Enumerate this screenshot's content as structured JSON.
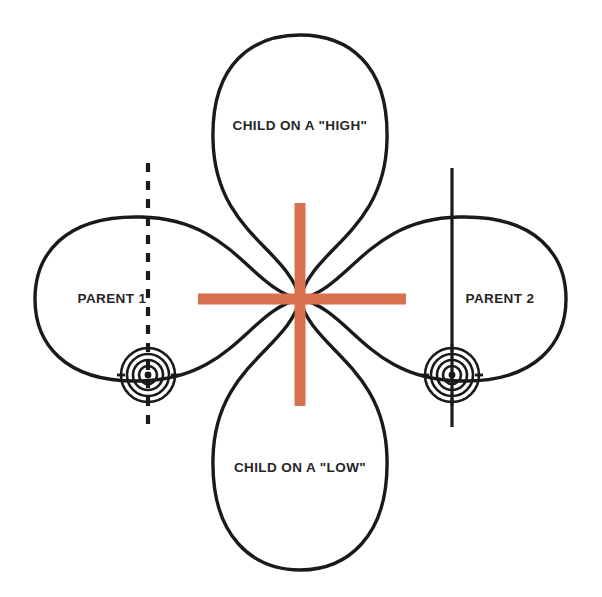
{
  "figure": {
    "background_color": "#ffffff",
    "stroke_color": "#1a1a1a",
    "accent_color": "#D9714E"
  },
  "labels": {
    "top": "CHILD ON A \"HIGH\"",
    "bottom": "CHILD ON A \"LOW\"",
    "left": "PARENT 1",
    "right": "PARENT 2"
  },
  "icons": {
    "cross": "orange-cross-icon",
    "target_left": "bullseye-target-icon",
    "target_right": "bullseye-target-icon",
    "axis_left": "dashed-vertical-axis-icon",
    "axis_right": "solid-vertical-axis-icon"
  },
  "chart_data": {
    "type": "diagram",
    "center": [
      300,
      299
    ],
    "petals": [
      {
        "name": "CHILD ON A \"HIGH\"",
        "direction": "up",
        "tip": [
          300,
          35
        ],
        "half_width": 85,
        "label_at": [
          300,
          125
        ]
      },
      {
        "name": "CHILD ON A \"LOW\"",
        "direction": "down",
        "tip": [
          300,
          570
        ],
        "half_width": 88,
        "label_at": [
          300,
          467
        ]
      },
      {
        "name": "PARENT 1",
        "direction": "left",
        "tip": [
          35,
          299
        ],
        "half_width": 86,
        "label_at": [
          112,
          298
        ]
      },
      {
        "name": "PARENT 2",
        "direction": "right",
        "tip": [
          566,
          299
        ],
        "half_width": 86,
        "label_at": [
          500,
          298
        ]
      }
    ],
    "cross": {
      "color": "#D9714E",
      "thickness": 11,
      "horizontal": {
        "x1": 198,
        "x2": 406,
        "y": 299
      },
      "vertical": {
        "y1": 203,
        "y2": 406,
        "x": 300
      }
    },
    "targets": [
      {
        "name": "target-left",
        "center": [
          148,
          375
        ],
        "rings": 4,
        "outer_radius": 28
      },
      {
        "name": "target-right",
        "center": [
          452,
          375
        ],
        "rings": 4,
        "outer_radius": 28
      }
    ],
    "axes": [
      {
        "name": "axis-left",
        "style": "dashed",
        "x": 148,
        "y1": 163,
        "y2": 427
      },
      {
        "name": "axis-right",
        "style": "solid",
        "x": 452,
        "y1": 168,
        "y2": 427
      }
    ]
  }
}
